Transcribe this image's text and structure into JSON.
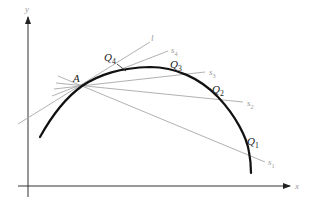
{
  "diagram": {
    "axes": {
      "x_label": "x",
      "y_label": "y"
    },
    "point": {
      "label": "A",
      "x": 82,
      "y": 86
    },
    "curve": {
      "path": "M40,137 C55,110 68,96 82,86 C100,74 120,68 150,67 C175,67 200,78 218,97 C236,116 247,138 249,152 C251,162 251,168 251,173"
    },
    "tangent": {
      "label": "l",
      "x1": 18,
      "y1": 124,
      "x2": 150,
      "y2": 42,
      "label_x": 151,
      "label_y": 41
    },
    "secants": [
      {
        "label": "s1",
        "sub": "1",
        "end_x": 265,
        "end_y": 162,
        "start_x": 58,
        "start_y": 76,
        "label_x": 268,
        "label_y": 165,
        "q_label": "Q",
        "q_sub": "1",
        "q_x": 247,
        "q_y": 145
      },
      {
        "label": "s2",
        "sub": "2",
        "end_x": 243,
        "end_y": 102,
        "start_x": 56,
        "start_y": 83,
        "label_x": 247,
        "label_y": 106,
        "q_label": "Q",
        "q_sub": "2",
        "q_x": 212,
        "q_y": 93
      },
      {
        "label": "s3",
        "sub": "3",
        "end_x": 205,
        "end_y": 72,
        "start_x": 54,
        "start_y": 89,
        "label_x": 209,
        "label_y": 75,
        "q_label": "Q",
        "q_sub": "3",
        "q_x": 170,
        "q_y": 68
      },
      {
        "label": "s4",
        "sub": "4",
        "end_x": 168,
        "end_y": 51,
        "start_x": 52,
        "start_y": 96,
        "label_x": 171,
        "label_y": 53,
        "q_label": "Q",
        "q_sub": "4",
        "q_x": 104,
        "q_y": 61
      }
    ],
    "q4_leader": {
      "x1": 117,
      "y1": 64,
      "x2": 126,
      "y2": 71
    },
    "colors": {
      "curve": "#111111",
      "axes": "#333333",
      "secant": "#a8a8a8",
      "label_dark": "#222222",
      "label_light": "#9a9a9a"
    }
  }
}
